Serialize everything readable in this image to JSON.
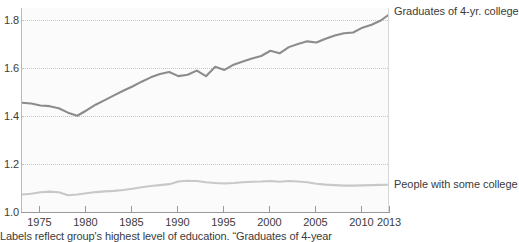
{
  "chart_data": {
    "type": "line",
    "title": "",
    "subtitle": "",
    "xlabel": "",
    "ylabel": "",
    "xlim": [
      1973,
      2013
    ],
    "ylim": [
      1.0,
      1.85
    ],
    "grid": "horizontal dotted at 1.2, 1.4, 1.6, 1.8",
    "legend_position": "inline right of plot",
    "y_ticks": [
      "1.0",
      "1.2",
      "1.4",
      "1.6",
      "1.8"
    ],
    "y_tick_values": [
      1.0,
      1.2,
      1.4,
      1.6,
      1.8
    ],
    "x_ticks": [
      "1975",
      "1980",
      "1985",
      "1990",
      "1995",
      "2000",
      "2005",
      "2010",
      "2013"
    ],
    "x_tick_values": [
      1975,
      1980,
      1985,
      1990,
      1995,
      2000,
      2005,
      2010,
      2013
    ],
    "x": [
      1973,
      1974,
      1975,
      1976,
      1977,
      1978,
      1979,
      1980,
      1981,
      1982,
      1983,
      1984,
      1985,
      1986,
      1987,
      1988,
      1989,
      1990,
      1991,
      1992,
      1993,
      1994,
      1995,
      1996,
      1997,
      1998,
      1999,
      2000,
      2001,
      2002,
      2003,
      2004,
      2005,
      2006,
      2007,
      2008,
      2009,
      2010,
      2011,
      2012,
      2013
    ],
    "series": [
      {
        "name": "Graduates of 4-yr. college",
        "color": "#8c8c8c",
        "label_x": 2013,
        "values": [
          1.455,
          1.452,
          1.444,
          1.441,
          1.432,
          1.414,
          1.401,
          1.423,
          1.447,
          1.466,
          1.486,
          1.505,
          1.523,
          1.543,
          1.561,
          1.575,
          1.583,
          1.566,
          1.572,
          1.589,
          1.566,
          1.605,
          1.592,
          1.614,
          1.627,
          1.64,
          1.65,
          1.672,
          1.661,
          1.687,
          1.7,
          1.711,
          1.706,
          1.722,
          1.735,
          1.745,
          1.748,
          1.768,
          1.78,
          1.798,
          1.826
        ]
      },
      {
        "name": "People with some college",
        "color": "#c8c8c8",
        "label_x": 2013,
        "values": [
          1.073,
          1.076,
          1.082,
          1.085,
          1.082,
          1.07,
          1.073,
          1.078,
          1.083,
          1.086,
          1.088,
          1.092,
          1.097,
          1.103,
          1.108,
          1.112,
          1.116,
          1.127,
          1.13,
          1.129,
          1.124,
          1.121,
          1.119,
          1.121,
          1.124,
          1.126,
          1.127,
          1.129,
          1.126,
          1.129,
          1.127,
          1.124,
          1.118,
          1.114,
          1.112,
          1.11,
          1.11,
          1.111,
          1.112,
          1.113,
          1.114
        ]
      }
    ],
    "annotations": {
      "footnote": "Labels reflect group's highest level of education. “Graduates of 4-year"
    }
  },
  "footnote": {
    "text": "Labels reflect group's highest level of education. “Graduates of 4-year"
  }
}
